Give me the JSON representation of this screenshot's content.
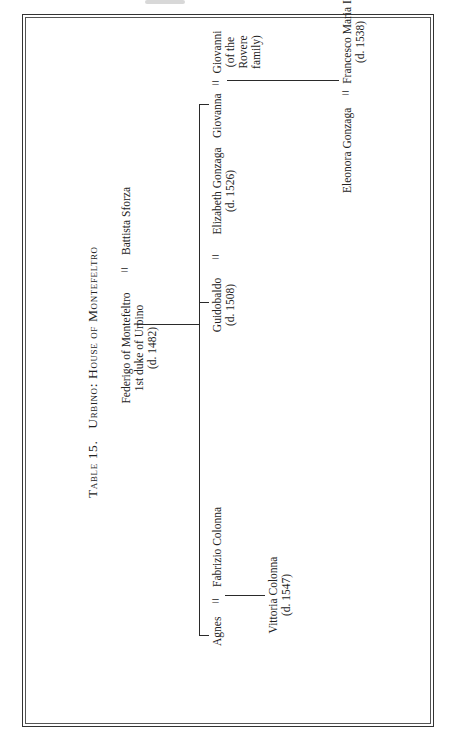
{
  "table": {
    "number_label": "Table 15.",
    "title_a": "Urbino:",
    "title_b": "House of Montefeltro"
  },
  "symbols": {
    "marriage": "="
  },
  "generation1": {
    "husband": {
      "name": "Federigo of Montefeltro",
      "title": "1st duke of Urbino",
      "death": "(d. 1482)"
    },
    "wife": {
      "name": "Battista Sforza"
    }
  },
  "generation2": [
    {
      "name": "Agnes",
      "spouse": "Fabrizio Colonna"
    },
    {
      "name": "Guidobaldo",
      "death": "(d. 1508)",
      "spouse": "Elizabeth Gonzaga",
      "spouse_death": "(d. 1526)"
    },
    {
      "name": "Giovanna",
      "spouse_lines": [
        "Giovanni",
        "(of the",
        "Rovere",
        "family)"
      ]
    }
  ],
  "generation3": [
    {
      "name": "Vittoria Colonna",
      "death": "(d. 1547)"
    },
    {
      "name": "Eleonora Gonzaga",
      "spouse": "Francesco Maria I",
      "spouse_death": "(d. 1538)"
    }
  ]
}
